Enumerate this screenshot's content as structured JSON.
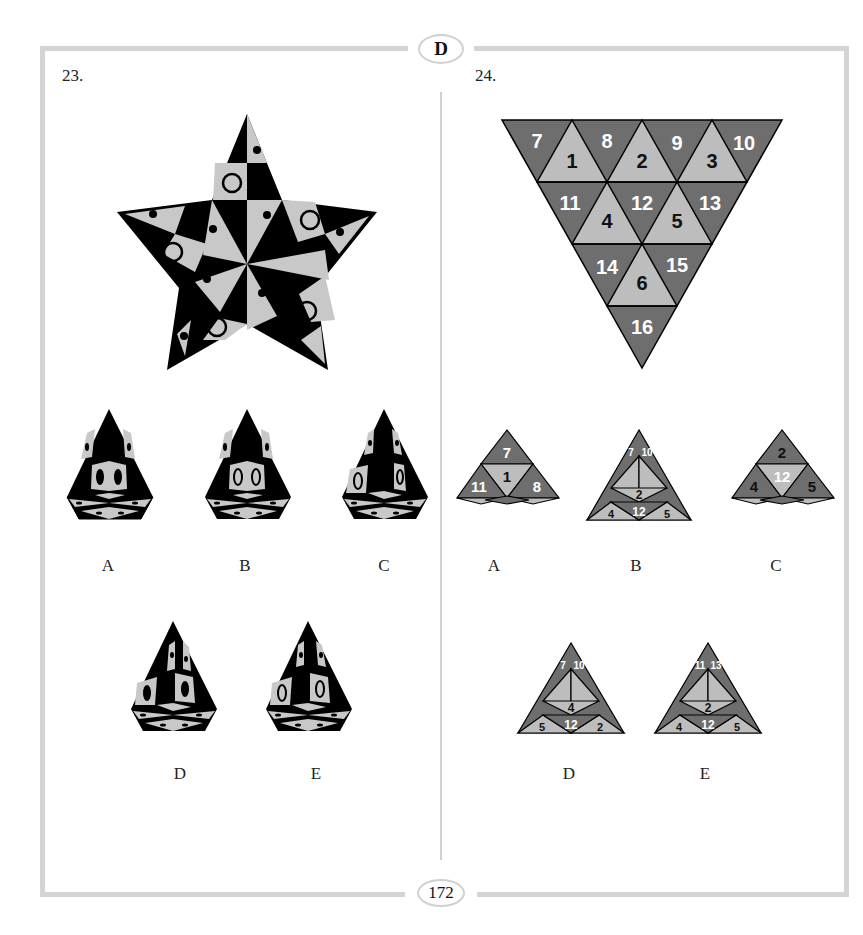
{
  "page": {
    "section_letter": "D",
    "page_number": "172"
  },
  "colors": {
    "frame": "#d4d4d4",
    "dark_tile": "#6e6e6e",
    "light_tile": "#bdbdbd",
    "black": "#000000",
    "star_light": "#c8c8c8"
  },
  "puzzles": [
    {
      "number": "23.",
      "figure": "five-pointed-star net with black and light-gray triangles, dots and circles",
      "options": [
        "A",
        "B",
        "C",
        "D",
        "E"
      ]
    },
    {
      "number": "24.",
      "figure": "inverted triangle net of 16 numbered triangles",
      "net_labels": {
        "row1": [
          "7",
          "1",
          "8",
          "2",
          "9",
          "3",
          "10"
        ],
        "row2": [
          "11",
          "4",
          "12",
          "5",
          "13"
        ],
        "row3": [
          "14",
          "6",
          "15"
        ],
        "row4": [
          "16"
        ]
      },
      "options": [
        "A",
        "B",
        "C",
        "D",
        "E"
      ],
      "option_faces": {
        "A": {
          "top": "7",
          "mid_left": "11",
          "mid_center": "1",
          "mid_right": "8",
          "bottom": [
            "4",
            "12",
            "5",
            "2"
          ]
        },
        "B": {
          "top_left": "7",
          "top_right": "10",
          "inner": [
            "7",
            "8",
            "9",
            "3",
            "2"
          ],
          "left_edge": "11",
          "right_edge": "13",
          "bottom": [
            "4",
            "12",
            "5"
          ]
        },
        "C": {
          "top": "2",
          "mid_left": "4",
          "mid_center": "12",
          "mid_right": "5",
          "bottom": [
            "9",
            "3",
            "10",
            "13"
          ]
        },
        "D": {
          "top_left": "7",
          "top_right": "10",
          "inner": [
            "1",
            "8",
            "9",
            "3",
            "4"
          ],
          "left_edge": "11",
          "right_edge": "13",
          "bottom": [
            "5",
            "12",
            "2"
          ]
        },
        "E": {
          "top_left": "11",
          "top_right": "13",
          "inner": [
            "1",
            "8",
            "9",
            "3",
            "2"
          ],
          "left_edge": "7",
          "right_edge": "10",
          "bottom": [
            "4",
            "12",
            "5"
          ]
        }
      }
    }
  ]
}
